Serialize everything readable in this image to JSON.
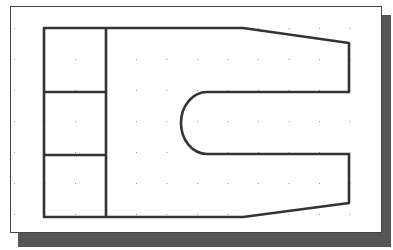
{
  "canvas": {
    "width": 393,
    "height": 250,
    "background": "#ffffff",
    "frame_border_color": "#444444",
    "shadow_color": "#555555",
    "line_color": "#333333",
    "grid_dot_color": "#999999"
  },
  "grid": {
    "spacing_x": 30.5,
    "spacing_y": 31,
    "origin_x": 14,
    "origin_y": 28
  },
  "part": {
    "description": "2D part outline with stacked left blocks, tapered right arms and a rounded U-slot",
    "left_blocks": 3,
    "slot_shape": "U-slot with semicircular end"
  }
}
